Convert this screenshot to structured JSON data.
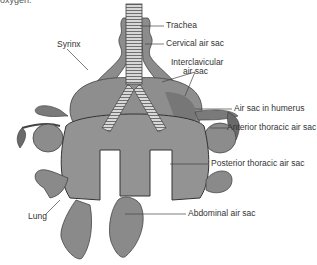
{
  "top_fragment": "oxygen.",
  "labels": {
    "trachea": "Trachea",
    "cervical": "Cervical air sac",
    "syrinx": "Syrinx",
    "interclavicular_1": "Interclavicular",
    "interclavicular_2": "air sac",
    "humerus": "Air sac in humerus",
    "anterior": "Anterior thoracic air sac",
    "posterior": "Posterior thoracic air sac",
    "lung": "Lung",
    "abdominal": "Abdominal air sac"
  },
  "colors": {
    "fill": "#8c8c8c",
    "dark": "#5a5a5a",
    "line": "#444444",
    "light": "#b0b0b0"
  }
}
